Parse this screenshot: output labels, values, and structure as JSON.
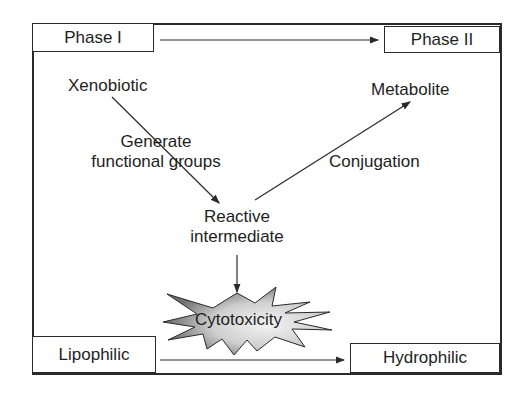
{
  "diagram": {
    "phases": {
      "start": "Phase I",
      "end": "Phase II"
    },
    "properties": {
      "start": "Lipophilic",
      "end": "Hydrophilic"
    },
    "nodes": {
      "xenobiotic": "Xenobiotic",
      "metabolite": "Metabolite",
      "reactive_line1": "Reactive",
      "reactive_line2": "intermediate",
      "cytotoxicity": "Cytotoxicity"
    },
    "edges": {
      "generate_line1": "Generate",
      "generate_line2": "functional groups",
      "conjugation": "Conjugation"
    },
    "colors": {
      "line": "#2a2a2a",
      "starburst_dark": "#7a7a7a",
      "starburst_light": "#f2f2f2"
    }
  }
}
